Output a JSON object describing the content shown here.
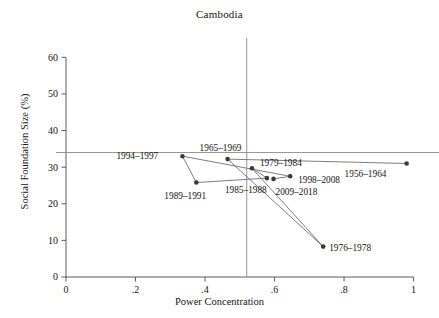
{
  "chart_data": {
    "type": "scatter",
    "title": "Cambodia",
    "xlabel": "Power Concentration",
    "ylabel": "Social Foundation Size (%)",
    "xlim": [
      0,
      1.03
    ],
    "ylim": [
      0,
      62
    ],
    "xticks": [
      0,
      0.2,
      0.4,
      0.6,
      0.8,
      1
    ],
    "xticklabels": [
      "0",
      ".2",
      ".4",
      ".6",
      ".8",
      "1"
    ],
    "yticks": [
      0,
      10,
      20,
      30,
      40,
      50,
      60
    ],
    "yticklabels": [
      "0",
      "10",
      "20",
      "30",
      "40",
      "50",
      "60"
    ],
    "grid": false,
    "legend": "none",
    "reference_lines": {
      "vertical_x": 0.52,
      "horizontal_y": 34,
      "color": "#8a8a8a"
    },
    "connector": {
      "description": "points connected in chronological order",
      "color": "#6f6f6f"
    },
    "marker_color": "#3a3a3a",
    "points": [
      {
        "label": "1956–1964",
        "x": 0.98,
        "y": 31.0,
        "label_dx": -62,
        "label_dy": 13
      },
      {
        "label": "1965–1969",
        "x": 0.465,
        "y": 32.2,
        "label_dx": -28,
        "label_dy": -8
      },
      {
        "label": "1976–1978",
        "x": 0.74,
        "y": 8.3,
        "label_dx": 6,
        "label_dy": 4
      },
      {
        "label": "1979–1984",
        "x": 0.535,
        "y": 29.7,
        "label_dx": 8,
        "label_dy": -2
      },
      {
        "label": "1985–1988",
        "x": 0.578,
        "y": 27.0,
        "label_dx": -42,
        "label_dy": 15
      },
      {
        "label": "1989–1991",
        "x": 0.375,
        "y": 25.8,
        "label_dx": -32,
        "label_dy": 16
      },
      {
        "label": "1994–1997",
        "x": 0.335,
        "y": 33.0,
        "label_dx": -66,
        "label_dy": 3
      },
      {
        "label": "1998–2008",
        "x": 0.645,
        "y": 27.5,
        "label_dx": 8,
        "label_dy": 7
      },
      {
        "label": "2009–2018",
        "x": 0.597,
        "y": 26.8,
        "label_dx": 2,
        "label_dy": 16
      }
    ],
    "path_order": [
      "1956–1964",
      "1965–1969",
      "1976–1978",
      "1979–1984",
      "1985–1988",
      "1989–1991",
      "1994–1997",
      "1998–2008",
      "2009–2018"
    ]
  }
}
